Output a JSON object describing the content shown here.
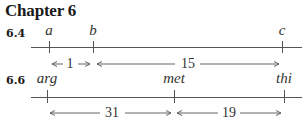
{
  "title": "Chapter 6",
  "problems": [
    {
      "label": "6.4",
      "points": [
        {
          "name": "a",
          "x": 49
        },
        {
          "name": "b",
          "x": 93
        },
        {
          "name": "c",
          "x": 282
        }
      ],
      "distances": [
        {
          "from": "a",
          "to": "b",
          "value": "1"
        },
        {
          "from": "b",
          "to": "c",
          "value": "15"
        }
      ]
    },
    {
      "label": "6.6",
      "points": [
        {
          "name": "arg",
          "x": 47
        },
        {
          "name": "met",
          "x": 174
        },
        {
          "name": "thi",
          "x": 284
        }
      ],
      "distances": [
        {
          "from": "arg",
          "to": "met",
          "value": "31"
        },
        {
          "from": "met",
          "to": "thi",
          "value": "19"
        }
      ]
    }
  ]
}
